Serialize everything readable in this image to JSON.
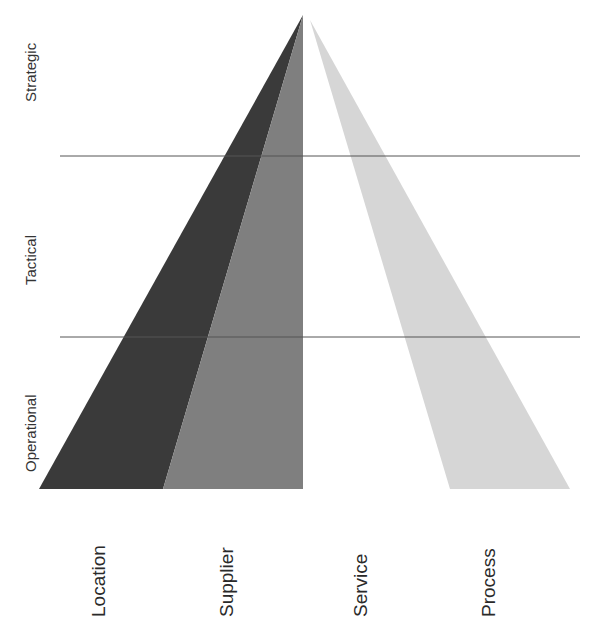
{
  "levels": [
    {
      "label": "Strategic"
    },
    {
      "label": "Tactical"
    },
    {
      "label": "Operational"
    }
  ],
  "categories": [
    {
      "label": "Location",
      "color": "#3a3a3a"
    },
    {
      "label": "Supplier",
      "color": "#7f7f7f"
    },
    {
      "label": "Service",
      "color": "#ffffff"
    },
    {
      "label": "Process",
      "color": "#d6d6d6"
    }
  ],
  "colors": {
    "divider": "#555555",
    "text": "#333333"
  }
}
